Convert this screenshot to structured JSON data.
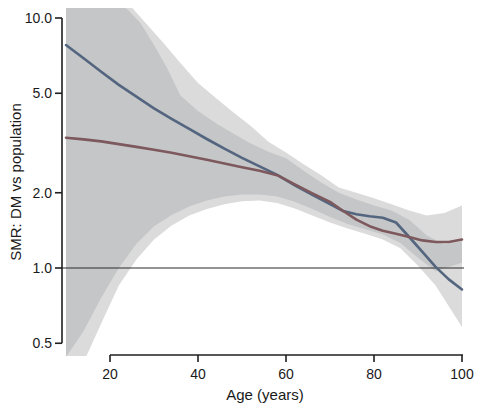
{
  "figure": {
    "background": "#ffffff",
    "axis_color": "#1f1f1f",
    "x_axis": {
      "label": "Age (years)",
      "tick_labels": [
        "20",
        "40",
        "60",
        "80",
        "100"
      ],
      "tick_values": [
        20,
        40,
        60,
        80,
        100
      ]
    },
    "y_axis": {
      "label": "SMR: DM vs population",
      "scale": "log10",
      "tick_labels": [
        "10.0",
        "5.0",
        "2.0",
        "1.0",
        "0.5"
      ],
      "tick_values": [
        10,
        5,
        2,
        1,
        0.5
      ]
    },
    "reference_line": {
      "value": 1.0,
      "color": "#2b2b2b"
    }
  },
  "chart_data": {
    "type": "line",
    "title": "",
    "xlabel": "Age (years)",
    "ylabel": "SMR: DM vs population",
    "x_range": [
      10,
      100
    ],
    "y_scale": "log10",
    "ylim": [
      0.45,
      11.0
    ],
    "x_ticks": [
      20,
      40,
      60,
      80,
      100
    ],
    "y_ticks": [
      10.0,
      5.0,
      2.0,
      1.0,
      0.5
    ],
    "grid": false,
    "legend": "none",
    "reference_line_y": 1.0,
    "series": [
      {
        "name": "steep-declining-curve",
        "color": "#54657f",
        "width": 2.6,
        "points": [
          [
            10,
            7.8
          ],
          [
            14,
            6.9
          ],
          [
            18,
            6.1
          ],
          [
            22,
            5.4
          ],
          [
            26,
            4.85
          ],
          [
            30,
            4.35
          ],
          [
            34,
            3.95
          ],
          [
            38,
            3.6
          ],
          [
            42,
            3.28
          ],
          [
            46,
            3.0
          ],
          [
            50,
            2.76
          ],
          [
            54,
            2.55
          ],
          [
            58,
            2.36
          ],
          [
            62,
            2.14
          ],
          [
            66,
            1.96
          ],
          [
            70,
            1.8
          ],
          [
            73,
            1.69
          ],
          [
            76,
            1.64
          ],
          [
            79,
            1.61
          ],
          [
            82,
            1.59
          ],
          [
            85,
            1.52
          ],
          [
            88,
            1.33
          ],
          [
            91,
            1.16
          ],
          [
            94,
            1.01
          ],
          [
            97,
            0.9
          ],
          [
            100,
            0.82
          ]
        ]
      },
      {
        "name": "gradual-declining-curve",
        "color": "#7d585d",
        "width": 2.6,
        "points": [
          [
            10,
            3.32
          ],
          [
            14,
            3.27
          ],
          [
            18,
            3.21
          ],
          [
            22,
            3.13
          ],
          [
            26,
            3.05
          ],
          [
            30,
            2.97
          ],
          [
            34,
            2.89
          ],
          [
            38,
            2.8
          ],
          [
            42,
            2.71
          ],
          [
            46,
            2.62
          ],
          [
            50,
            2.53
          ],
          [
            54,
            2.45
          ],
          [
            58,
            2.35
          ],
          [
            62,
            2.16
          ],
          [
            66,
            1.99
          ],
          [
            70,
            1.84
          ],
          [
            73,
            1.69
          ],
          [
            76,
            1.56
          ],
          [
            79,
            1.47
          ],
          [
            82,
            1.41
          ],
          [
            85,
            1.37
          ],
          [
            88,
            1.33
          ],
          [
            91,
            1.29
          ],
          [
            94,
            1.27
          ],
          [
            97,
            1.27
          ],
          [
            100,
            1.3
          ]
        ]
      }
    ],
    "bands": [
      {
        "name": "confidence-band-union-light",
        "color": "#dbdbdb",
        "upper": [
          [
            10,
            13
          ],
          [
            20,
            13
          ],
          [
            24,
            11.5
          ],
          [
            28,
            9.6
          ],
          [
            32,
            8.0
          ],
          [
            36,
            6.6
          ],
          [
            40,
            5.5
          ],
          [
            44,
            4.8
          ],
          [
            48,
            4.2
          ],
          [
            52,
            3.7
          ],
          [
            56,
            3.2
          ],
          [
            60,
            2.9
          ],
          [
            64,
            2.6
          ],
          [
            68,
            2.35
          ],
          [
            72,
            2.1
          ],
          [
            76,
            2.0
          ],
          [
            80,
            1.9
          ],
          [
            84,
            1.8
          ],
          [
            88,
            1.7
          ],
          [
            92,
            1.62
          ],
          [
            96,
            1.66
          ],
          [
            100,
            1.78
          ]
        ],
        "lower": [
          [
            10,
            0.3
          ],
          [
            14,
            0.42
          ],
          [
            18,
            0.6
          ],
          [
            22,
            0.85
          ],
          [
            26,
            1.08
          ],
          [
            30,
            1.3
          ],
          [
            34,
            1.48
          ],
          [
            38,
            1.62
          ],
          [
            42,
            1.72
          ],
          [
            46,
            1.8
          ],
          [
            50,
            1.85
          ],
          [
            54,
            1.86
          ],
          [
            58,
            1.82
          ],
          [
            62,
            1.73
          ],
          [
            66,
            1.62
          ],
          [
            70,
            1.52
          ],
          [
            74,
            1.44
          ],
          [
            78,
            1.37
          ],
          [
            82,
            1.3
          ],
          [
            86,
            1.2
          ],
          [
            90,
            1.02
          ],
          [
            94,
            0.85
          ],
          [
            100,
            0.58
          ]
        ]
      },
      {
        "name": "confidence-band-overlap-dark",
        "color": "#c4c6c7",
        "upper": [
          [
            10,
            12
          ],
          [
            20,
            12
          ],
          [
            24,
            10.8
          ],
          [
            27,
            9.5
          ],
          [
            30,
            7.8
          ],
          [
            33,
            6.3
          ],
          [
            36,
            4.9
          ],
          [
            40,
            4.25
          ],
          [
            44,
            3.8
          ],
          [
            48,
            3.45
          ],
          [
            52,
            3.15
          ],
          [
            56,
            2.92
          ],
          [
            60,
            2.75
          ],
          [
            64,
            2.45
          ],
          [
            68,
            2.2
          ],
          [
            72,
            2.0
          ],
          [
            76,
            1.88
          ],
          [
            80,
            1.78
          ],
          [
            84,
            1.7
          ],
          [
            88,
            1.56
          ],
          [
            92,
            1.35
          ],
          [
            96,
            1.24
          ],
          [
            100,
            1.28
          ]
        ],
        "lower": [
          [
            10,
            0.44
          ],
          [
            14,
            0.56
          ],
          [
            18,
            0.76
          ],
          [
            22,
            1.0
          ],
          [
            26,
            1.25
          ],
          [
            30,
            1.47
          ],
          [
            34,
            1.63
          ],
          [
            38,
            1.76
          ],
          [
            42,
            1.86
          ],
          [
            46,
            1.93
          ],
          [
            50,
            1.97
          ],
          [
            54,
            1.97
          ],
          [
            58,
            1.93
          ],
          [
            62,
            1.84
          ],
          [
            66,
            1.72
          ],
          [
            70,
            1.6
          ],
          [
            74,
            1.5
          ],
          [
            78,
            1.43
          ],
          [
            82,
            1.36
          ],
          [
            86,
            1.26
          ],
          [
            90,
            1.1
          ],
          [
            94,
            0.97
          ],
          [
            100,
            1.05
          ]
        ]
      }
    ]
  }
}
